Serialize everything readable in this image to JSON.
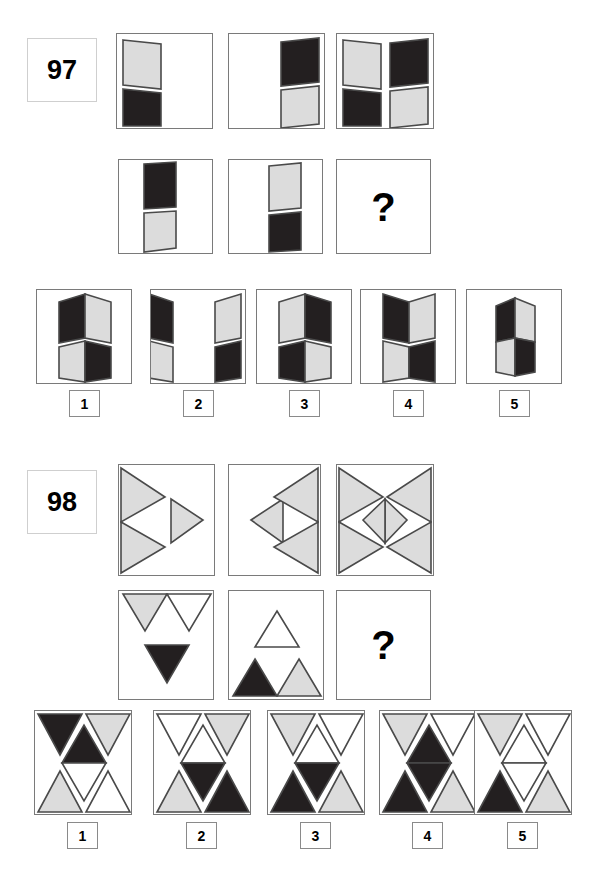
{
  "page": {
    "width": 599,
    "height": 885,
    "background": "#ffffff",
    "type": "visual-reasoning-test-sheet"
  },
  "colors": {
    "black_fill": "#231f20",
    "gray_fill": "#dcdcdc",
    "white_fill": "#ffffff",
    "outline": "#4a4a4a",
    "frame": "#7a7a7a",
    "label_border": "#cfcfcf",
    "text": "#000000"
  },
  "puzzles": [
    {
      "id": "97",
      "number_label": "97",
      "question_mark": "?",
      "row1": [
        {
          "name": "panel-1",
          "description": "folded-panel: gray upper parallelogram and black lower parallelogram at left side"
        },
        {
          "name": "panel-2",
          "description": "folded-panel: black upper parallelogram and gray lower parallelogram at right side"
        },
        {
          "name": "panel-3",
          "description": "combination of panel-1 and panel-2 overlaid"
        }
      ],
      "row2": [
        {
          "name": "panel-4",
          "description": "folded-panel: black upper and gray lower parallelogram slightly left of centre"
        },
        {
          "name": "panel-5",
          "description": "folded-panel: gray upper and black lower parallelogram slightly right of centre"
        },
        {
          "name": "panel-6-missing",
          "description": "missing tile marked with question mark"
        }
      ],
      "options": [
        {
          "label": "1",
          "description": "joined pair: black+gray upper fold, gray+black lower fold, centred"
        },
        {
          "label": "2",
          "description": "two separate folds pushed to the far left and far right edges"
        },
        {
          "label": "3",
          "description": "joined pair: gray left / black right upper, black left / gray right lower"
        },
        {
          "label": "4",
          "description": "joined pair: black left / gray right upper, gray left / black right lower"
        },
        {
          "label": "5",
          "description": "single narrow joined fold: black upper-left, gray lower-left, gray upper-right, black lower-right"
        }
      ]
    },
    {
      "id": "98",
      "number_label": "98",
      "question_mark": "?",
      "row1": [
        {
          "name": "panel-1",
          "description": "two large gray right-pointing triangles on left edge plus small gray right-pointing triangle in centre"
        },
        {
          "name": "panel-2",
          "description": "small gray left-pointing triangle in centre plus two large gray left-pointing triangles on right edge"
        },
        {
          "name": "panel-3",
          "description": "combination of panel-1 and panel-2 forming a gray bowtie lattice with central diamond"
        }
      ],
      "row2": [
        {
          "name": "panel-4",
          "description": "gray and white downward triangles along the top edge plus black downward triangle in centre"
        },
        {
          "name": "panel-5",
          "description": "white upward triangle in centre plus black and gray upward triangles along the bottom edge"
        },
        {
          "name": "panel-6-missing",
          "description": "missing tile marked with question mark"
        }
      ],
      "options": [
        {
          "label": "1",
          "description": "black top-left, gray top-right, black centre-upper, white centre-lower, gray bottom-left, white bottom-right"
        },
        {
          "label": "2",
          "description": "white top-left, gray top-right, white centre-upper, black centre-lower, gray bottom-left, black bottom-right"
        },
        {
          "label": "3",
          "description": "gray top-left, white top-right, white centre-upper, black centre-lower, black bottom-left, gray bottom-right"
        },
        {
          "label": "4",
          "description": "gray top-left, white top-right, black centre-upper, black centre-lower, black bottom-left, gray bottom-right"
        },
        {
          "label": "5",
          "description": "gray top-left, white top-right, white centre-upper, white centre-lower, black bottom-left, gray bottom-right"
        }
      ]
    }
  ]
}
